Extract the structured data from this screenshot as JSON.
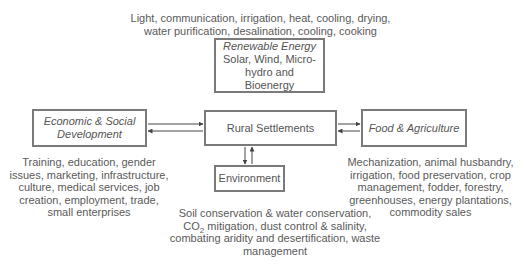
{
  "diagram": {
    "nodes": {
      "renewable_energy": {
        "title": "Renewable Energy",
        "subtitle_line1": "Solar, Wind, Micro-hydro and",
        "subtitle_line2": "Bioenergy"
      },
      "economic_social": {
        "title_line1": "Economic & Social",
        "title_line2": "Development"
      },
      "rural_settlements": {
        "title": "Rural Settlements"
      },
      "food_agriculture": {
        "title": "Food & Agriculture"
      },
      "environment": {
        "title": "Environment"
      }
    },
    "annotations": {
      "energy_uses": [
        "Light, communication, irrigation, heat, cooling, drying,",
        "water purification, desalination, cooling, cooking"
      ],
      "economic_social_items": [
        "Training, education, gender",
        "issues, marketing, infrastructure,",
        "culture, medical services, job",
        "creation, employment, trade,",
        "small enterprises"
      ],
      "food_agriculture_items": [
        "Mechanization, animal husbandry,",
        "irrigation, food preservation, crop",
        "management, fodder, forestry,",
        "greenhouses, energy plantations,",
        "commodity sales"
      ],
      "environment_items": {
        "line1": "Soil conservation & water conservation,",
        "line2_pre": "CO",
        "line2_sub": "2",
        "line2_post": " mitigation, dust control & salinity,",
        "line3": "combating aridity and desertification, waste",
        "line4": "management"
      }
    },
    "edges": [
      {
        "from": "economic_social",
        "to": "rural_settlements",
        "bidirectional": true
      },
      {
        "from": "rural_settlements",
        "to": "food_agriculture",
        "bidirectional": true
      },
      {
        "from": "rural_settlements",
        "to": "environment",
        "bidirectional": true
      }
    ],
    "colors": {
      "border": "#7a7a7a",
      "text": "#555555",
      "arrow": "#444444"
    }
  }
}
